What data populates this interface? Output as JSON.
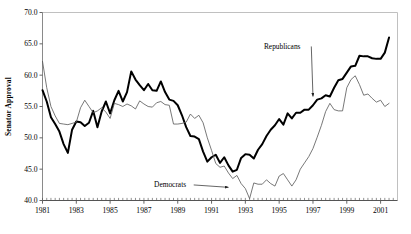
{
  "chart_data": {
    "type": "line",
    "title": "",
    "subtitle": "",
    "xlabel": "",
    "ylabel": "Senator Approval",
    "xlim": [
      1981.0,
      2002.0
    ],
    "ylim": [
      40.0,
      70.0
    ],
    "grid": false,
    "legend_position": "none",
    "y_ticks": [
      "70.0",
      "65.0",
      "60.0",
      "55.0",
      "50.0",
      "45.0",
      "40.0"
    ],
    "y_tick_values": [
      70.0,
      65.0,
      60.0,
      55.0,
      50.0,
      45.0,
      40.0
    ],
    "x_ticks": [
      "1981",
      "1983",
      "1985",
      "1987",
      "1989",
      "1991",
      "1993",
      "1995",
      "1997",
      "1999",
      "2001"
    ],
    "x_tick_values": [
      1981,
      1983,
      1985,
      1987,
      1989,
      1991,
      1993,
      1995,
      1997,
      1999,
      2001
    ],
    "annotations": [
      {
        "name": "republicans-annotation",
        "text": "Republicans",
        "x": 1994.1,
        "y": 64.2,
        "arrow_to_x": 1997.0,
        "arrow_to_y": 56.6
      },
      {
        "name": "democrats-annotation",
        "text": "Democrats",
        "x": 1987.6,
        "y": 42.1,
        "arrow_to_x": 1992.0,
        "arrow_to_y": 42.1
      }
    ],
    "series": [
      {
        "name": "Republicans",
        "color": "#000000",
        "line_width": 2.0,
        "x": [
          1981.0,
          1981.25,
          1981.5,
          1981.75,
          1982.0,
          1982.25,
          1982.5,
          1982.75,
          1983.0,
          1983.25,
          1983.5,
          1983.75,
          1984.0,
          1984.25,
          1984.5,
          1984.75,
          1985.0,
          1985.25,
          1985.5,
          1985.75,
          1986.0,
          1986.25,
          1986.5,
          1986.75,
          1987.0,
          1987.25,
          1987.5,
          1987.75,
          1988.0,
          1988.25,
          1988.5,
          1988.75,
          1989.0,
          1989.25,
          1989.5,
          1989.75,
          1990.0,
          1990.25,
          1990.5,
          1990.75,
          1991.0,
          1991.25,
          1991.5,
          1991.75,
          1992.0,
          1992.25,
          1992.5,
          1992.75,
          1993.0,
          1993.25,
          1993.5,
          1993.75,
          1994.0,
          1994.25,
          1994.5,
          1994.75,
          1995.0,
          1995.25,
          1995.5,
          1995.75,
          1996.0,
          1996.25,
          1996.5,
          1996.75,
          1997.0,
          1997.25,
          1997.5,
          1997.75,
          1998.0,
          1998.25,
          1998.5,
          1998.75,
          1999.0,
          1999.25,
          1999.5,
          1999.75,
          2000.0,
          2000.25,
          2000.5,
          2000.75,
          2001.0,
          2001.25,
          2001.5
        ],
        "values": [
          57.6,
          55.8,
          53.3,
          52.2,
          51.0,
          49.0,
          47.6,
          51.3,
          52.6,
          52.5,
          51.9,
          52.4,
          54.3,
          51.7,
          54.2,
          55.8,
          53.9,
          56.0,
          57.5,
          55.8,
          57.3,
          60.6,
          59.3,
          58.4,
          57.6,
          58.6,
          57.6,
          57.5,
          59.0,
          57.3,
          56.1,
          55.9,
          55.2,
          53.6,
          51.7,
          50.3,
          50.2,
          49.8,
          47.8,
          46.2,
          46.9,
          47.3,
          46.0,
          46.9,
          45.6,
          44.6,
          44.9,
          46.8,
          47.4,
          47.3,
          46.7,
          48.1,
          49.0,
          50.3,
          51.3,
          52.0,
          53.0,
          52.1,
          53.9,
          53.1,
          54.0,
          54.0,
          54.5,
          54.5,
          55.2,
          56.1,
          56.3,
          56.8,
          56.6,
          58.0,
          59.2,
          59.4,
          60.4,
          61.4,
          61.5,
          63.1,
          63.0,
          63.0,
          62.7,
          62.6,
          62.6,
          63.6,
          66.0
        ]
      },
      {
        "name": "Democrats",
        "color": "#555555",
        "line_width": 0.8,
        "x": [
          1981.0,
          1981.25,
          1981.5,
          1981.75,
          1982.0,
          1982.25,
          1982.5,
          1982.75,
          1983.0,
          1983.25,
          1983.5,
          1983.75,
          1984.0,
          1984.25,
          1984.5,
          1984.75,
          1985.0,
          1985.25,
          1985.5,
          1985.75,
          1986.0,
          1986.25,
          1986.5,
          1986.75,
          1987.0,
          1987.25,
          1987.5,
          1987.75,
          1988.0,
          1988.25,
          1988.5,
          1988.75,
          1989.0,
          1989.25,
          1989.5,
          1989.75,
          1990.0,
          1990.25,
          1990.5,
          1990.75,
          1991.0,
          1991.25,
          1991.5,
          1991.75,
          1992.0,
          1992.25,
          1992.5,
          1992.75,
          1993.0,
          1993.25,
          1993.5,
          1993.75,
          1994.0,
          1994.25,
          1994.5,
          1994.75,
          1995.0,
          1995.25,
          1995.5,
          1995.75,
          1996.0,
          1996.25,
          1996.5,
          1996.75,
          1997.0,
          1997.25,
          1997.5,
          1997.75,
          1998.0,
          1998.25,
          1998.5,
          1998.75,
          1999.0,
          1999.25,
          1999.5,
          1999.75,
          2000.0,
          2000.25,
          2000.5,
          2000.75,
          2001.0,
          2001.25,
          2001.5
        ],
        "values": [
          62.2,
          58.0,
          55.0,
          53.5,
          52.3,
          52.2,
          52.1,
          52.3,
          52.5,
          54.8,
          56.0,
          55.0,
          54.0,
          54.3,
          54.8,
          54.1,
          53.1,
          55.5,
          55.3,
          55.0,
          55.4,
          55.1,
          54.6,
          55.9,
          55.4,
          55.0,
          54.9,
          55.6,
          55.8,
          55.3,
          55.2,
          52.2,
          52.2,
          52.3,
          52.5,
          53.8,
          53.1,
          53.6,
          52.4,
          50.0,
          48.0,
          45.9,
          45.3,
          45.5,
          44.4,
          43.5,
          44.0,
          42.7,
          41.9,
          40.3,
          42.8,
          42.6,
          42.6,
          43.3,
          42.7,
          42.3,
          43.9,
          44.3,
          43.3,
          42.3,
          43.3,
          45.0,
          46.0,
          47.0,
          48.3,
          50.1,
          52.0,
          54.2,
          55.5,
          54.5,
          54.3,
          54.3,
          58.0,
          59.3,
          59.9,
          58.5,
          56.8,
          57.0,
          56.3,
          55.7,
          56.0,
          55.0,
          55.5
        ]
      }
    ]
  }
}
